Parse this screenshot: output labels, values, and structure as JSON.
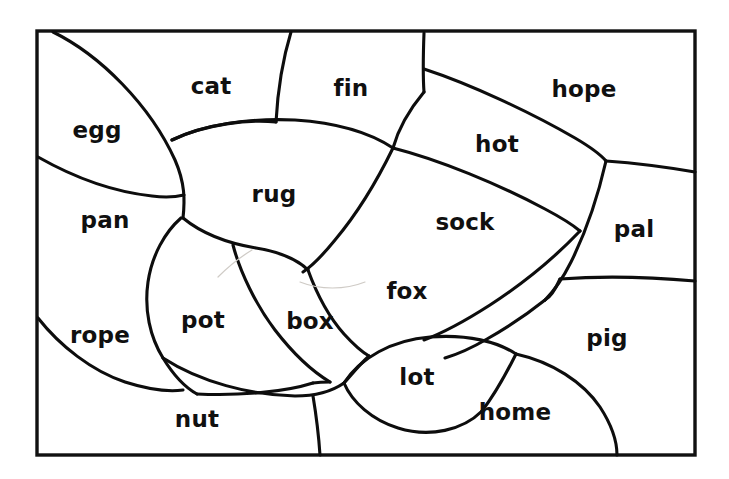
{
  "page": {
    "background_color": "#ffffff",
    "ink_color": "#0d0d0d",
    "frame_color": "#111111",
    "faint_line_color": "#cfcbc6",
    "width": 729,
    "height": 479
  },
  "frame": {
    "x": 37,
    "y": 31,
    "width": 658,
    "height": 424
  },
  "puzzle": {
    "type": "word-puzzle-coloring-map",
    "region_count": 18,
    "regions": [
      {
        "id": "egg",
        "label": "egg",
        "label_x": 97,
        "label_y": 130
      },
      {
        "id": "cat",
        "label": "cat",
        "label_x": 211,
        "label_y": 86
      },
      {
        "id": "fin",
        "label": "fin",
        "label_x": 351,
        "label_y": 88
      },
      {
        "id": "hope",
        "label": "hope",
        "label_x": 584,
        "label_y": 89
      },
      {
        "id": "hot",
        "label": "hot",
        "label_x": 497,
        "label_y": 144
      },
      {
        "id": "pan",
        "label": "pan",
        "label_x": 105,
        "label_y": 220
      },
      {
        "id": "rug",
        "label": "rug",
        "label_x": 274,
        "label_y": 194
      },
      {
        "id": "sock",
        "label": "sock",
        "label_x": 465,
        "label_y": 222
      },
      {
        "id": "pal",
        "label": "pal",
        "label_x": 634,
        "label_y": 229
      },
      {
        "id": "fox",
        "label": "fox",
        "label_x": 407,
        "label_y": 291
      },
      {
        "id": "rope",
        "label": "rope",
        "label_x": 100,
        "label_y": 335
      },
      {
        "id": "pot",
        "label": "pot",
        "label_x": 203,
        "label_y": 320
      },
      {
        "id": "box",
        "label": "box",
        "label_x": 310,
        "label_y": 321
      },
      {
        "id": "pig",
        "label": "pig",
        "label_x": 607,
        "label_y": 338
      },
      {
        "id": "lot",
        "label": "lot",
        "label_x": 417,
        "label_y": 377
      },
      {
        "id": "nut",
        "label": "nut",
        "label_x": 197,
        "label_y": 419
      },
      {
        "id": "home",
        "label": "home",
        "label_x": 515,
        "label_y": 412
      }
    ],
    "word_list": [
      "egg",
      "cat",
      "fin",
      "hope",
      "hot",
      "pan",
      "rug",
      "sock",
      "pal",
      "fox",
      "rope",
      "pot",
      "box",
      "pig",
      "lot",
      "nut",
      "home"
    ],
    "boundaries": [
      {
        "id": "egg-top-arc",
        "d": "M 53 32 C 100 55 150 105 175 160 C 185 183 185 200 183 218"
      },
      {
        "id": "egg-pan-divider",
        "d": "M 38 157 C 75 178 115 192 152 196 C 166 198 176 197 184 195"
      },
      {
        "id": "rug-top-arc",
        "d": "M 172 140 C 205 124 250 118 295 120 C 340 123 372 134 393 148"
      },
      {
        "id": "cat-fin-divider",
        "d": "M 291 32 C 284 55 278 85 276 122"
      },
      {
        "id": "fin-hot-divider",
        "d": "M 424 33 C 423 60 423 78 424 92"
      },
      {
        "id": "fin-rug-right",
        "d": "M 424 92 C 409 110 398 130 393 148"
      },
      {
        "id": "hot-hope-divider",
        "d": "M 424 69 C 470 84 530 112 575 138 C 592 148 601 155 606 161"
      },
      {
        "id": "hot-sock-divider",
        "d": "M 393 148 C 440 160 498 184 545 209 C 562 218 573 225 580 231"
      },
      {
        "id": "hope-pal-right",
        "d": "M 606 161 C 634 163 666 167 695 172"
      },
      {
        "id": "hot-pal-divider",
        "d": "M 606 161 C 598 196 586 232 571 262 C 562 280 553 292 545 300"
      },
      {
        "id": "pal-pig-divider",
        "d": "M 560 279 C 600 276 650 277 695 281"
      },
      {
        "id": "rug-right-lower",
        "d": "M 393 148 C 376 183 356 215 335 240 C 322 256 312 266 303 272"
      },
      {
        "id": "rug-bottom",
        "d": "M 183 218 C 200 232 226 243 256 248 C 286 253 302 260 310 268"
      },
      {
        "id": "sock-fox-divider",
        "d": "M 580 231 C 560 252 527 281 490 305 C 462 323 440 334 424 340"
      },
      {
        "id": "fox-box-divider",
        "d": "M 303 272 C 312 292 326 316 342 334 C 352 345 360 351 367 355"
      },
      {
        "id": "pot-box-divider",
        "d": "M 233 245 C 240 272 256 305 275 330 C 295 356 315 373 330 382"
      },
      {
        "id": "rope-pot-divider",
        "d": "M 181 218 C 165 232 152 255 148 282 C 144 310 150 337 163 358 C 174 376 186 388 197 394"
      },
      {
        "id": "rope-bottom-arc",
        "d": "M 38 318 C 60 346 92 371 125 382 C 150 390 168 392 183 390"
      },
      {
        "id": "nut-top-arc",
        "d": "M 163 358 C 200 382 250 395 295 396 C 318 396 334 390 344 383"
      },
      {
        "id": "nut-right-divider",
        "d": "M 313 396 C 317 420 319 440 320 455"
      },
      {
        "id": "lot-top-arc",
        "d": "M 344 383 C 360 358 392 340 430 337 C 468 334 498 342 516 354"
      },
      {
        "id": "lot-bottom-arc",
        "d": "M 344 383 C 352 402 372 420 398 428 C 430 438 463 430 482 411"
      },
      {
        "id": "home-pig-divider",
        "d": "M 516 354 C 552 362 583 382 600 407 C 613 427 617 443 617 455"
      },
      {
        "id": "fox-lot-left",
        "d": "M 367 355 C 360 364 352 374 344 383"
      },
      {
        "id": "pig-top-divider",
        "d": "M 545 300 C 580 291 640 288 695 292"
      },
      {
        "id": "home-left-tip",
        "d": "M 482 411 C 490 400 500 382 512 364"
      }
    ],
    "faint_marks": [
      {
        "id": "faint-pot-streak",
        "d": "M 218 277 C 230 265 242 256 252 250"
      },
      {
        "id": "faint-box-streak",
        "d": "M 300 282 C 320 290 345 290 365 282"
      }
    ]
  }
}
